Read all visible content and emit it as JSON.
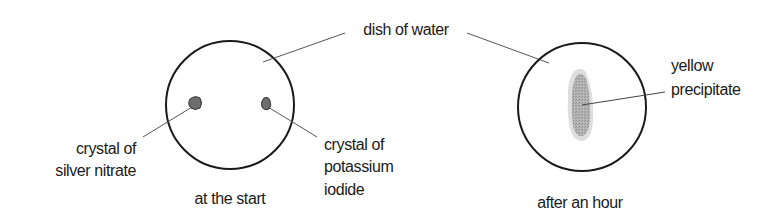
{
  "diagram": {
    "shared_label": "dish of water",
    "panels": [
      {
        "caption": "at the start",
        "labels": {
          "left": [
            "crystal of",
            "silver nitrate"
          ],
          "right": [
            "crystal of",
            "potassium",
            "iodide"
          ]
        }
      },
      {
        "caption": "after an hour",
        "labels": {
          "right": [
            "yellow",
            "precipitate"
          ]
        }
      }
    ]
  },
  "colors": {
    "outline": "#1a1a1a",
    "leader_line": "#555555",
    "crystal_fill": "#6e6e6e",
    "precipitate_outer": "#dedede",
    "precipitate_inner": "#a9a9a9"
  }
}
